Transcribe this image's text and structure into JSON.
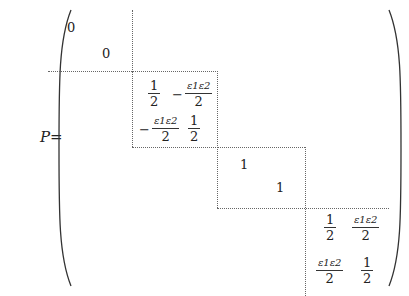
{
  "equation": {
    "lhs": "P=",
    "block1": {
      "diag": [
        "0",
        "0"
      ]
    },
    "block2": {
      "a11": {
        "sign": "",
        "num": "1",
        "den": "2"
      },
      "a12": {
        "sign": "−",
        "num": "ε1ε2",
        "den": "2"
      },
      "a21": {
        "sign": "−",
        "num": "ε1ε2",
        "den": "2"
      },
      "a22": {
        "sign": "",
        "num": "1",
        "den": "2"
      }
    },
    "block3": {
      "diag": [
        "1",
        "1"
      ]
    },
    "block4": {
      "a11": {
        "sign": "",
        "num": "1",
        "den": "2"
      },
      "a12": {
        "sign": "",
        "num": "ε1ε2",
        "den": "2"
      },
      "a21": {
        "sign": "",
        "num": "ε1ε2",
        "den": "2"
      },
      "a22": {
        "sign": "",
        "num": "1",
        "den": "2"
      }
    }
  }
}
